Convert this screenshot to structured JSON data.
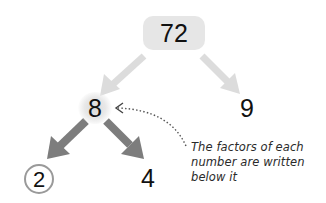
{
  "diagram": {
    "type": "factor-tree",
    "root": {
      "value": "72",
      "style": "rounded-box",
      "fill": "#e6e6e6"
    },
    "level1": [
      {
        "value": "8",
        "highlight": "glow"
      },
      {
        "value": "9"
      }
    ],
    "level2": [
      {
        "value": "2",
        "parent": "8",
        "marker": "circled",
        "circle_color": "#9a9a9a"
      },
      {
        "value": "4",
        "parent": "8"
      }
    ],
    "annotation": {
      "lines": [
        "The factors of each",
        "number are written",
        "below it"
      ],
      "points_to": "8",
      "connector": "dotted-curved-arrow"
    },
    "edges": [
      {
        "from": "72",
        "to": "8",
        "color": "#dcdcdc"
      },
      {
        "from": "72",
        "to": "9",
        "color": "#dcdcdc"
      },
      {
        "from": "8",
        "to": "2",
        "color": "#7d7d7d"
      },
      {
        "from": "8",
        "to": "4",
        "color": "#7d7d7d"
      }
    ],
    "colors": {
      "light_arrow": "#dcdcdc",
      "dark_arrow": "#7d7d7d",
      "text": "#111111",
      "dotted_line": "#555555"
    }
  }
}
